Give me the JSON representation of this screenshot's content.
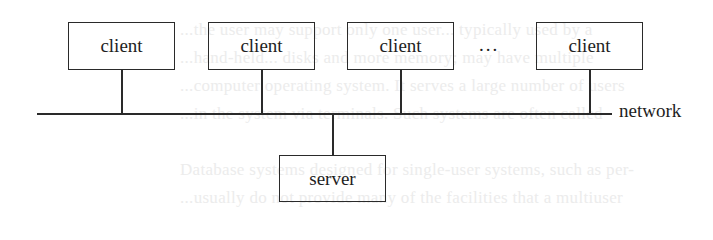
{
  "diagram": {
    "type": "client-server network",
    "clients": [
      {
        "label": "client"
      },
      {
        "label": "client"
      },
      {
        "label": "client"
      },
      {
        "label": "client"
      }
    ],
    "ellipsis": "...",
    "network_label": "network",
    "server": {
      "label": "server"
    }
  },
  "background_text": [
    "...the user may support only one user... typically used by a",
    "...hand-held... disks and more memory; may have multiple",
    "...computer operating system. It serves a large number of users",
    "...in the system via terminals. Such systems are often called",
    "Database systems designed for single-user systems, such as per-",
    "...usually do not provide many of the facilities that a multiuser"
  ]
}
